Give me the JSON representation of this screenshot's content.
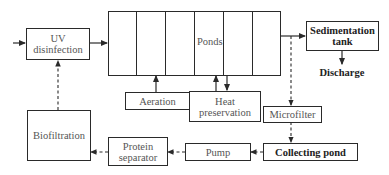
{
  "diagram": {
    "nodes": {
      "uv": {
        "label_line1": "UV",
        "label_line2": "disinfection"
      },
      "ponds": {
        "label": "Ponds",
        "segments": 6
      },
      "sedimentation": {
        "label_line1": "Sedimentation",
        "label_line2": "tank"
      },
      "discharge": {
        "label": "Discharge"
      },
      "aeration": {
        "label": "Aeration"
      },
      "heat": {
        "label_line1": "Heat",
        "label_line2": "preservation"
      },
      "microfilter": {
        "label": "Microfilter"
      },
      "collecting": {
        "label": "Collecting pond"
      },
      "pump": {
        "label": "Pump"
      },
      "protein": {
        "label_line1": "Protein",
        "label_line2": "separator"
      },
      "biofiltration": {
        "label": "Biofiltration"
      }
    },
    "edges": [
      {
        "from": "input",
        "to": "uv",
        "style": "solid"
      },
      {
        "from": "uv",
        "to": "ponds",
        "style": "solid"
      },
      {
        "from": "ponds",
        "to": "sedimentation",
        "style": "solid"
      },
      {
        "from": "sedimentation",
        "to": "discharge",
        "style": "solid"
      },
      {
        "from": "aeration",
        "to": "ponds",
        "style": "solid"
      },
      {
        "from": "heat",
        "to": "ponds",
        "style": "solid"
      },
      {
        "from": "ponds",
        "to": "heat",
        "style": "solid"
      },
      {
        "from": "ponds",
        "to": "microfilter",
        "style": "dashed"
      },
      {
        "from": "microfilter",
        "to": "collecting",
        "style": "dashed"
      },
      {
        "from": "collecting",
        "to": "pump",
        "style": "dashed"
      },
      {
        "from": "pump",
        "to": "protein",
        "style": "dashed"
      },
      {
        "from": "protein",
        "to": "biofiltration",
        "style": "dashed"
      },
      {
        "from": "biofiltration",
        "to": "uv",
        "style": "dashed"
      }
    ],
    "colors": {
      "line": "#2a2a2a",
      "text": "#555555"
    }
  }
}
